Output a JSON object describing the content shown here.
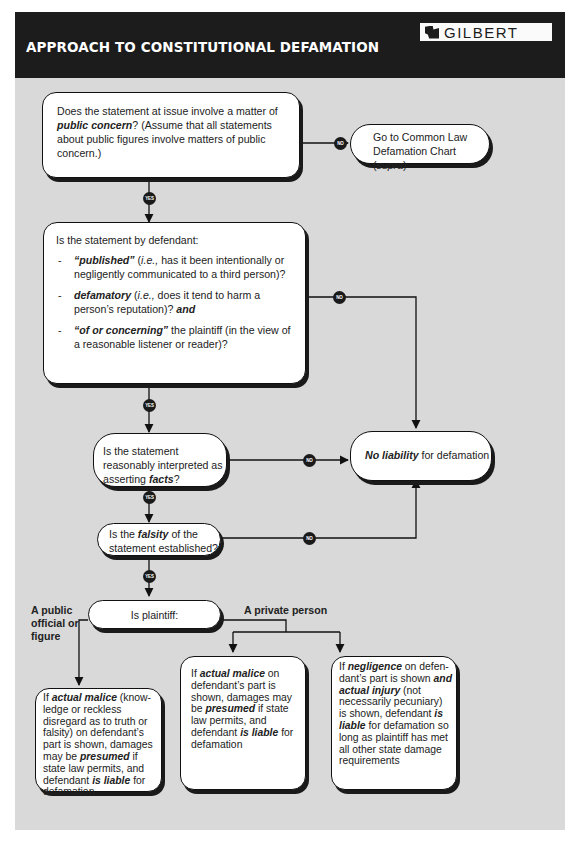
{
  "header": {
    "title": "APPROACH TO CONSTITUTIONAL DEFAMATION",
    "logo_text": "GILBERT"
  },
  "colors": {
    "header_bg": "#1c1c1c",
    "panel_bg": "#d9d9d9",
    "box_bg": "#ffffff",
    "line": "#111111"
  },
  "nodes": {
    "q1": {
      "pre": "Does the statement at issue involve a matter of ",
      "em": "public concern",
      "post": "? (Assume that all statements about public figures involve matters of public concern.)"
    },
    "common_law": {
      "pre": "Go to Common Law Defamation Chart (",
      "em": "supra",
      "post": ")"
    },
    "q2": {
      "intro": "Is the statement by defendant:",
      "items": [
        {
          "em": "“published”",
          "mid1": " (",
          "i": "i.e.,",
          "post": " has it been intentionally or negligently communicated to a third person)?"
        },
        {
          "em": "defamatory",
          "mid1": " (",
          "i": "i.e.,",
          "post": " does it tend to harm a person’s reputation)? ",
          "em2": "and"
        },
        {
          "em": "“of or concerning”",
          "post": " the plaintiff (in the view of a reasonable listener or reader)?"
        }
      ]
    },
    "q3": {
      "pre": "Is the statement reasonably interpreted as asserting ",
      "em": "facts",
      "post": "?"
    },
    "q4": {
      "pre": "Is the ",
      "em": "falsity",
      "post": " of the statement established?"
    },
    "no_liability": {
      "em": "No liability",
      "post": " for defamation"
    },
    "q5": {
      "text": "Is plaintiff:"
    },
    "r1": {
      "a": "If ",
      "b": "actual malice",
      "c": " (know-ledge or reckless disregard as to truth or falsity) on defendant’s part is shown, damages may be ",
      "d": "presumed",
      "e": " if state law permits, and defendant ",
      "f": "is liable",
      "g": " for defamation"
    },
    "r2": {
      "a": "If ",
      "b": "actual malice",
      "c": " on defendant’s part is shown, damages may be ",
      "d": "presumed",
      "e": " if state law permits, and defendant ",
      "f": "is liable",
      "g": " for defamation"
    },
    "r3": {
      "a": "If ",
      "b": "negligence",
      "c": " on defen-dant’s part is shown ",
      "d": "and actual injury",
      "e": " (not necessarily pecuniary) is shown, defendant ",
      "f": "is liable",
      "g": " for defamation so long as plaintiff has met all other state damage requirements"
    }
  },
  "branches": {
    "public": "A public official or figure",
    "private": "A private person"
  },
  "badges": {
    "yes": "YES",
    "no": "NO"
  }
}
